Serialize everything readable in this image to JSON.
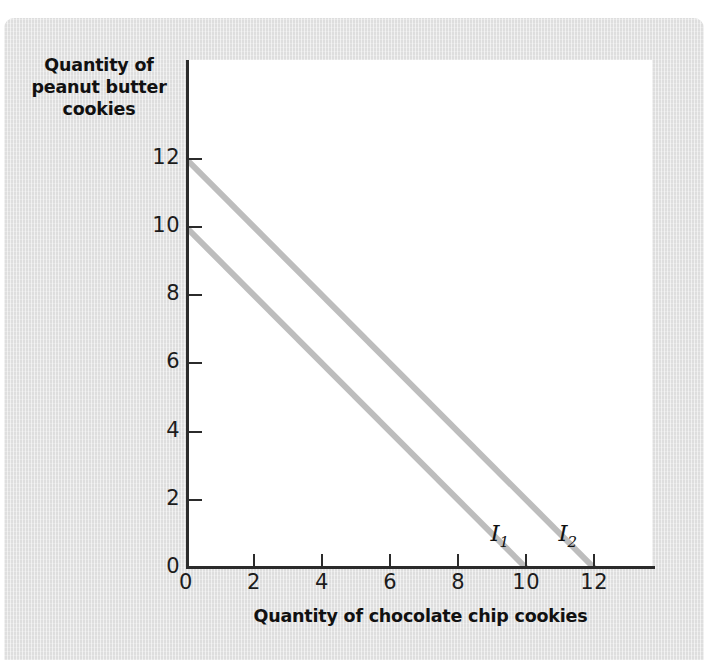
{
  "chart_data": {
    "type": "line",
    "title": "",
    "xlabel": "Quantity of chocolate chip cookies",
    "ylabel": "Quantity of peanut butter cookies",
    "ylabel_lines": [
      "Quantity of",
      "peanut butter",
      "cookies"
    ],
    "xlim": [
      0,
      13.7
    ],
    "ylim": [
      0,
      14.9
    ],
    "xticks": [
      0,
      2,
      4,
      6,
      8,
      10,
      12
    ],
    "yticks": [
      0,
      2,
      4,
      6,
      8,
      10,
      12
    ],
    "xticklabels": [
      "0",
      "2",
      "4",
      "6",
      "8",
      "10",
      "12"
    ],
    "yticklabels": [
      "0",
      "2",
      "4",
      "6",
      "8",
      "10",
      "12"
    ],
    "grid": false,
    "legend": "none",
    "line_color": "#bdbdbd",
    "axis_color": "#2b2b2b",
    "background_color": "#dedede",
    "plot_background_color": "#ffffff",
    "series": [
      {
        "name": "I1",
        "label": "I",
        "label_sub": "1",
        "label_x": 8.95,
        "label_y": 0.95,
        "x": [
          0,
          10
        ],
        "y": [
          10,
          0
        ]
      },
      {
        "name": "I2",
        "label": "I",
        "label_sub": "2",
        "label_x": 10.95,
        "label_y": 0.95,
        "x": [
          0,
          12
        ],
        "y": [
          12,
          0
        ]
      }
    ]
  }
}
